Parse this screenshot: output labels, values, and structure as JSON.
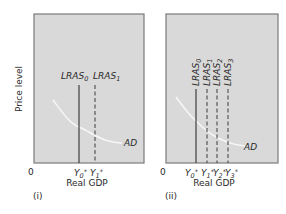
{
  "y_axis_label": "Price level",
  "x_axis_label": "Real GDP",
  "origin_label": "0",
  "curve_label": "AD",
  "colors": {
    "panel_fill": "#d9d9d9",
    "panel_border": "#7a7a7a",
    "curve": "#f4f4f4",
    "lines": "#4a4a4a",
    "text": "#2a2a2a"
  },
  "panels": [
    {
      "id": "i",
      "label": "(i)",
      "lras": [
        {
          "base": "LRAS",
          "sub": "0",
          "style": "solid"
        },
        {
          "base": "LRAS",
          "sub": "1",
          "style": "dashed"
        }
      ],
      "ticks": [
        {
          "base": "Y",
          "sub": "0",
          "sup": "*"
        },
        {
          "base": "Y",
          "sub": "1",
          "sup": "*"
        }
      ]
    },
    {
      "id": "ii",
      "label": "(ii)",
      "lras": [
        {
          "base": "LRAS",
          "sub": "0",
          "style": "solid"
        },
        {
          "base": "LRAS",
          "sub": "1",
          "style": "dashed"
        },
        {
          "base": "LRAS",
          "sub": "2",
          "style": "dashed"
        },
        {
          "base": "LRAS",
          "sub": "3",
          "style": "dashed"
        }
      ],
      "ticks": [
        {
          "base": "Y",
          "sub": "0",
          "sup": "*"
        },
        {
          "base": "Y",
          "sub": "1",
          "sup": "*"
        },
        {
          "base": "Y",
          "sub": "2",
          "sup": "*"
        },
        {
          "base": "Y",
          "sub": "3",
          "sup": "*"
        }
      ]
    }
  ]
}
